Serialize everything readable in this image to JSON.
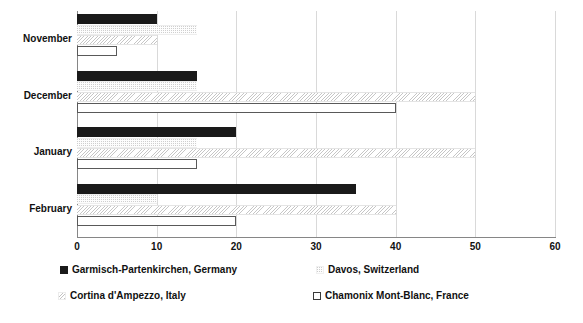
{
  "chart_data": {
    "type": "bar",
    "orientation": "horizontal",
    "title": "",
    "xlabel": "",
    "ylabel": "",
    "xlim": [
      0,
      60
    ],
    "xticks": [
      0,
      10,
      20,
      30,
      40,
      50,
      60
    ],
    "xtick_labels": [
      "0",
      "10",
      "20",
      "30",
      "40",
      "50",
      "60"
    ],
    "grid": true,
    "grid_axis": "x",
    "legend_position": "bottom",
    "categories": [
      "November",
      "December",
      "January",
      "February"
    ],
    "series": [
      {
        "name": "Garmisch-Partenkirchen, Germany",
        "pattern": "solid-black",
        "color": "#1a1a1a",
        "values": [
          10,
          15,
          20,
          35
        ]
      },
      {
        "name": "Davos, Switzerland",
        "pattern": "fine-dotted-light",
        "color": "#fdfdfd",
        "values": [
          15,
          15,
          15,
          10
        ]
      },
      {
        "name": "Cortina d'Ampezzo, Italy",
        "pattern": "diagonal-hatch-light",
        "color": "#fbfbfb",
        "values": [
          10,
          50,
          50,
          40
        ]
      },
      {
        "name": "Chamonix Mont-Blanc, France",
        "pattern": "white-outlined",
        "color": "#ffffff",
        "values": [
          5,
          40,
          15,
          20
        ]
      }
    ]
  },
  "legend": {
    "items": [
      {
        "label": "Garmisch-Partenkirchen, Germany"
      },
      {
        "label": "Davos, Switzerland"
      },
      {
        "label": "Cortina d'Ampezzo, Italy"
      },
      {
        "label": "Chamonix Mont-Blanc, France"
      }
    ]
  }
}
